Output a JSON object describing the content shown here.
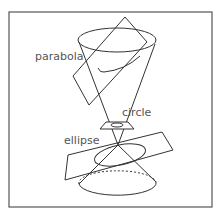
{
  "diagram": {
    "labels": {
      "parabola": "parabola",
      "circle": "circle",
      "ellipse": "ellipse"
    },
    "colors": {
      "stroke": "#333333",
      "label": "#555555",
      "background": "#ffffff"
    }
  }
}
